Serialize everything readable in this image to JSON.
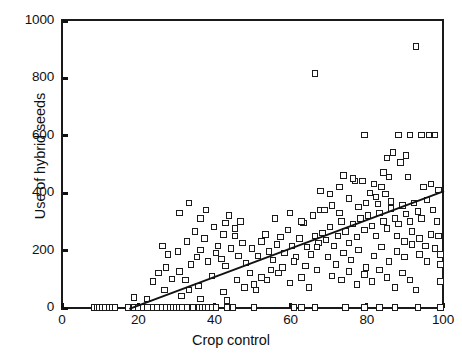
{
  "chart_data": {
    "type": "scatter",
    "title": "",
    "xlabel": "Crop control",
    "ylabel": "Use of hybrid seeds",
    "xlim": [
      0,
      100
    ],
    "ylim": [
      0,
      1000
    ],
    "xticks": [
      0,
      20,
      40,
      60,
      80,
      100
    ],
    "yticks": [
      0,
      200,
      400,
      600,
      800,
      1000
    ],
    "grid": false,
    "legend": null,
    "marker": "open-square",
    "marker_color": "#1b1b1b",
    "fit_line": {
      "label": "linear regression fit",
      "color": "#121212",
      "x_start": 17.5,
      "y_start": 0,
      "x_end": 100,
      "y_end": 410
    },
    "points": [
      [
        8.5,
        0
      ],
      [
        9.3,
        0
      ],
      [
        10.0,
        0
      ],
      [
        10.8,
        0
      ],
      [
        11.6,
        0
      ],
      [
        12.4,
        0
      ],
      [
        13.2,
        0
      ],
      [
        14.0,
        0
      ],
      [
        17.5,
        0
      ],
      [
        19.0,
        0
      ],
      [
        20.2,
        0
      ],
      [
        21.4,
        0
      ],
      [
        22.6,
        0
      ],
      [
        24.0,
        0
      ],
      [
        25.2,
        0
      ],
      [
        26.4,
        0
      ],
      [
        27.6,
        0
      ],
      [
        28.6,
        0
      ],
      [
        29.4,
        0
      ],
      [
        30.2,
        0
      ],
      [
        31.0,
        0
      ],
      [
        31.8,
        0
      ],
      [
        33.0,
        0
      ],
      [
        34.5,
        0
      ],
      [
        36.2,
        0
      ],
      [
        37.0,
        0
      ],
      [
        37.8,
        0
      ],
      [
        38.6,
        0
      ],
      [
        39.6,
        0
      ],
      [
        40.6,
        0
      ],
      [
        43.4,
        0
      ],
      [
        45.0,
        0
      ],
      [
        50.5,
        0
      ],
      [
        61.0,
        0
      ],
      [
        63.0,
        0
      ],
      [
        66.5,
        0
      ],
      [
        74.5,
        0
      ],
      [
        79.5,
        0
      ],
      [
        83.5,
        0
      ],
      [
        87.5,
        0
      ],
      [
        93.5,
        0
      ],
      [
        99.5,
        0
      ],
      [
        27.0,
        60
      ],
      [
        31.5,
        40
      ],
      [
        36.0,
        75
      ],
      [
        36.5,
        30
      ],
      [
        42.5,
        55
      ],
      [
        43.5,
        25
      ],
      [
        50.5,
        80
      ],
      [
        19.0,
        35
      ],
      [
        22.5,
        30
      ],
      [
        24.0,
        90
      ],
      [
        25.5,
        120
      ],
      [
        27.5,
        140
      ],
      [
        29.0,
        100
      ],
      [
        31.0,
        125
      ],
      [
        32.5,
        95
      ],
      [
        33.5,
        60
      ],
      [
        34.0,
        150
      ],
      [
        35.5,
        175
      ],
      [
        36.5,
        200
      ],
      [
        30.5,
        195
      ],
      [
        28.0,
        185
      ],
      [
        26.5,
        215
      ],
      [
        33.0,
        230
      ],
      [
        35.0,
        265
      ],
      [
        37.5,
        240
      ],
      [
        38.5,
        160
      ],
      [
        39.5,
        110
      ],
      [
        40.5,
        190
      ],
      [
        41.0,
        215
      ],
      [
        42.0,
        170
      ],
      [
        43.0,
        145
      ],
      [
        44.5,
        205
      ],
      [
        45.5,
        250
      ],
      [
        46.5,
        180
      ],
      [
        47.5,
        225
      ],
      [
        48.5,
        155
      ],
      [
        31.0,
        330
      ],
      [
        36.5,
        310
      ],
      [
        43.0,
        295
      ],
      [
        33.5,
        365
      ],
      [
        38.0,
        340
      ],
      [
        50.0,
        205
      ],
      [
        51.5,
        180
      ],
      [
        52.5,
        230
      ],
      [
        53.5,
        255
      ],
      [
        54.5,
        195
      ],
      [
        55.5,
        165
      ],
      [
        56.5,
        220
      ],
      [
        57.5,
        245
      ],
      [
        58.5,
        190
      ],
      [
        59.5,
        270
      ],
      [
        60.5,
        215
      ],
      [
        61.5,
        175
      ],
      [
        62.5,
        240
      ],
      [
        63.5,
        295
      ],
      [
        64.5,
        210
      ],
      [
        65.5,
        185
      ],
      [
        66.5,
        250
      ],
      [
        67.5,
        225
      ],
      [
        56.0,
        310
      ],
      [
        60.0,
        330
      ],
      [
        63.0,
        300
      ],
      [
        66.0,
        320
      ],
      [
        68.0,
        340
      ],
      [
        66.5,
        815
      ],
      [
        79.5,
        600
      ],
      [
        79.0,
        440
      ],
      [
        82.0,
        430
      ],
      [
        86.0,
        455
      ],
      [
        93.0,
        910
      ],
      [
        88.5,
        600
      ],
      [
        91.5,
        600
      ],
      [
        94.5,
        600
      ],
      [
        96.5,
        600
      ],
      [
        98.0,
        600
      ],
      [
        85.5,
        520
      ],
      [
        87.0,
        540
      ],
      [
        89.0,
        505
      ],
      [
        90.5,
        530
      ],
      [
        68.5,
        260
      ],
      [
        69.5,
        235
      ],
      [
        70.5,
        280
      ],
      [
        71.5,
        215
      ],
      [
        72.5,
        250
      ],
      [
        73.5,
        300
      ],
      [
        74.5,
        265
      ],
      [
        75.5,
        225
      ],
      [
        76.5,
        290
      ],
      [
        77.5,
        245
      ],
      [
        78.5,
        310
      ],
      [
        79.5,
        270
      ],
      [
        80.5,
        320
      ],
      [
        81.5,
        285
      ],
      [
        82.5,
        250
      ],
      [
        83.5,
        330
      ],
      [
        84.5,
        300
      ],
      [
        85.5,
        275
      ],
      [
        86.5,
        345
      ],
      [
        87.5,
        310
      ],
      [
        88.5,
        290
      ],
      [
        89.5,
        355
      ],
      [
        90.5,
        325
      ],
      [
        91.5,
        300
      ],
      [
        92.5,
        365
      ],
      [
        93.5,
        335
      ],
      [
        94.5,
        310
      ],
      [
        96.0,
        375
      ],
      [
        97.5,
        340
      ],
      [
        99.0,
        410
      ],
      [
        70.0,
        175
      ],
      [
        72.0,
        150
      ],
      [
        74.0,
        190
      ],
      [
        76.0,
        165
      ],
      [
        78.0,
        200
      ],
      [
        80.0,
        140
      ],
      [
        82.0,
        180
      ],
      [
        84.0,
        210
      ],
      [
        86.0,
        160
      ],
      [
        88.0,
        195
      ],
      [
        90.0,
        175
      ],
      [
        92.0,
        220
      ],
      [
        94.0,
        185
      ],
      [
        96.0,
        160
      ],
      [
        98.0,
        205
      ],
      [
        99.5,
        185
      ],
      [
        99.5,
        150
      ],
      [
        71.0,
        110
      ],
      [
        73.5,
        95
      ],
      [
        75.5,
        125
      ],
      [
        77.5,
        80
      ],
      [
        79.5,
        115
      ],
      [
        81.5,
        90
      ],
      [
        83.5,
        130
      ],
      [
        85.5,
        105
      ],
      [
        87.5,
        70
      ],
      [
        89.5,
        120
      ],
      [
        91.5,
        95
      ],
      [
        93.0,
        60
      ],
      [
        68.0,
        405
      ],
      [
        70.5,
        395
      ],
      [
        73.0,
        420
      ],
      [
        75.5,
        380
      ],
      [
        77.0,
        440
      ],
      [
        80.0,
        365
      ],
      [
        81.0,
        400
      ],
      [
        82.5,
        385
      ],
      [
        84.0,
        420
      ],
      [
        85.0,
        395
      ],
      [
        54.0,
        95
      ],
      [
        57.0,
        120
      ],
      [
        60.0,
        85
      ],
      [
        63.0,
        105
      ],
      [
        65.0,
        70
      ],
      [
        67.0,
        130
      ],
      [
        46.0,
        95
      ],
      [
        48.0,
        70
      ],
      [
        49.5,
        120
      ],
      [
        51.0,
        60
      ],
      [
        52.5,
        105
      ],
      [
        88.0,
        250
      ],
      [
        90.0,
        230
      ],
      [
        92.0,
        265
      ],
      [
        94.0,
        240
      ],
      [
        95.5,
        215
      ],
      [
        97.0,
        255
      ],
      [
        69.0,
        340
      ],
      [
        71.0,
        355
      ],
      [
        73.0,
        330
      ],
      [
        78.0,
        350
      ],
      [
        83.0,
        360
      ],
      [
        86.5,
        370
      ],
      [
        74.0,
        460
      ],
      [
        76.5,
        450
      ],
      [
        84.5,
        470
      ],
      [
        91.0,
        455
      ],
      [
        67.0,
        210
      ],
      [
        64.0,
        145
      ],
      [
        61.0,
        160
      ],
      [
        58.0,
        140
      ],
      [
        55.0,
        130
      ],
      [
        44.0,
        320
      ],
      [
        47.0,
        300
      ],
      [
        40.0,
        280
      ],
      [
        42.5,
        255
      ],
      [
        45.5,
        275
      ],
      [
        95.0,
        420
      ],
      [
        97.0,
        430
      ],
      [
        98.5,
        300
      ],
      [
        99.0,
        250
      ],
      [
        99.5,
        90
      ]
    ]
  }
}
